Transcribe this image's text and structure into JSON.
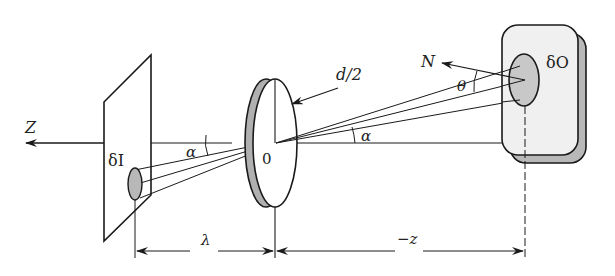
{
  "diagram": {
    "colors": {
      "line": "#1a1a1a",
      "gray_fill": "#b8b8b8",
      "plate_fill": "#f0f0f0",
      "background": "#ffffff"
    },
    "labels": {
      "axis": "Z",
      "image_element": "δI",
      "image_angle": "α",
      "lens_center": "0",
      "lens_radius": "d/2",
      "object_angle": "α",
      "normal": "N",
      "tilt_angle": "θ",
      "object_element": "δO",
      "image_distance": "λ",
      "object_distance": "−z"
    },
    "components": [
      {
        "id": "image-plane",
        "label": "δI"
      },
      {
        "id": "lens",
        "label": "0"
      },
      {
        "id": "object-surface",
        "label": "δO"
      }
    ]
  }
}
